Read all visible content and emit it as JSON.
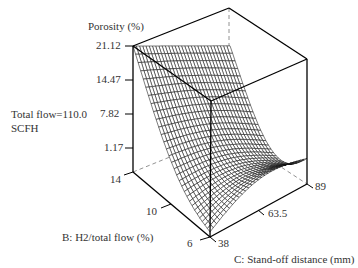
{
  "chart_data": {
    "type": "surface3d",
    "title": "",
    "zlabel": "Porosity (%)",
    "xlabel": "B: H2/total flow (%)",
    "ylabel": "C: Stand-off distance (mm)",
    "annotation": [
      "Total flow=110.0",
      "SCFH"
    ],
    "z_ticks": [
      "21.12",
      "14.47",
      "7.82",
      "1.17"
    ],
    "b_ticks": [
      "14",
      "10",
      "6"
    ],
    "c_ticks": [
      "38",
      "63.5",
      "89"
    ],
    "b_range": [
      6,
      14
    ],
    "c_range": [
      38,
      89
    ],
    "z_range": [
      1.17,
      21.12
    ],
    "corner_values": {
      "B14_C38": 21.12,
      "B14_C89": 10.8,
      "B6_C38": -2.5,
      "B6_C89": 1.5
    }
  },
  "labels": {
    "zlabel": "Porosity (%)",
    "annotation_line1": "Total flow=110.0",
    "annotation_line2": "SCFH",
    "blabel": "B: H2/total flow (%)",
    "clabel": "C: Stand-off distance (mm)",
    "z0": "21.12",
    "z1": "14.47",
    "z2": "7.82",
    "z3": "1.17",
    "b0": "14",
    "b1": "10",
    "b2": "6",
    "c0": "38",
    "c1": "63.5",
    "c2": "89"
  }
}
